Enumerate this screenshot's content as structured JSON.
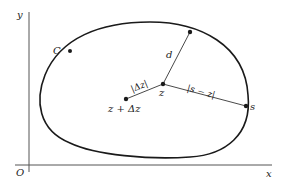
{
  "diagram": {
    "axes": {
      "origin_label": "O",
      "x_label": "x",
      "y_label": "y"
    },
    "curve": {
      "label": "C"
    },
    "points": {
      "z": "z",
      "z_plus_dz": "z + Δz",
      "s": "s"
    },
    "segments": {
      "d": "d",
      "dz": "|Δz|",
      "s_minus_z": "|s − z|"
    },
    "colors": {
      "stroke": "#1a1a1a",
      "axis": "#555555",
      "background": "#ffffff"
    }
  }
}
